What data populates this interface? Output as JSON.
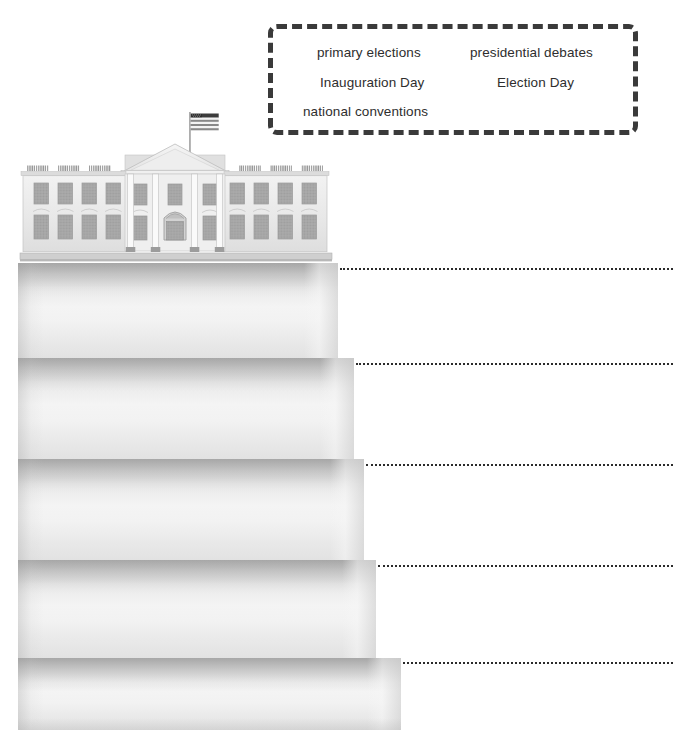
{
  "page": {
    "background_color": "#ffffff",
    "width": 689,
    "height": 740
  },
  "word_bank": {
    "border_color": "#3a3a3a",
    "border_style": "dashed",
    "rows": [
      {
        "left": "primary elections",
        "right": "presidential debates"
      },
      {
        "left": "Inauguration Day",
        "right": "Election Day"
      },
      {
        "left": "national conventions",
        "right": ""
      }
    ],
    "terms": [
      "primary elections",
      "presidential debates",
      "Inauguration Day",
      "Election Day",
      "national conventions"
    ]
  },
  "illustration": {
    "name": "white-house",
    "flag": "american-flag",
    "base_color": "#ececec",
    "outline_color": "#b4b4b4"
  },
  "staircase": {
    "step_count": 5,
    "step_color_light": "#f4f4f4",
    "step_color_shade": "#c9c9c9",
    "steps": [
      {
        "index": 1,
        "top": 263,
        "height": 95,
        "right_edge": 338,
        "answer_line_y": 268,
        "answer_line_x": 340,
        "answer_value": ""
      },
      {
        "index": 2,
        "top": 358,
        "height": 101,
        "right_edge": 354,
        "answer_line_y": 363,
        "answer_line_x": 356,
        "answer_value": ""
      },
      {
        "index": 3,
        "top": 459,
        "height": 101,
        "right_edge": 364,
        "answer_line_y": 464,
        "answer_line_x": 366,
        "answer_value": ""
      },
      {
        "index": 4,
        "top": 560,
        "height": 98,
        "right_edge": 376,
        "answer_line_y": 565,
        "answer_line_x": 378,
        "answer_value": ""
      },
      {
        "index": 5,
        "top": 658,
        "height": 69,
        "right_edge": 401,
        "answer_line_y": 662,
        "answer_line_x": 403,
        "answer_value": ""
      }
    ],
    "answer_line_end_x": 673,
    "answer_line_color": "#2b2b2b"
  }
}
